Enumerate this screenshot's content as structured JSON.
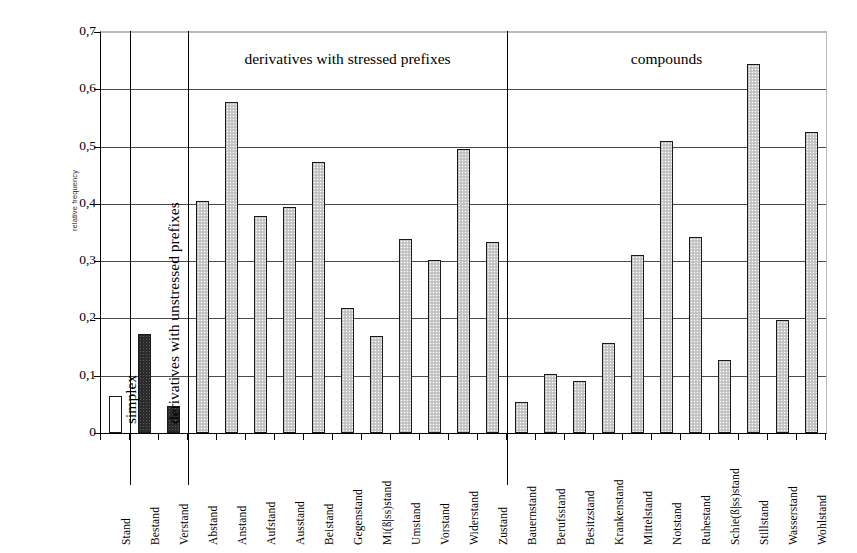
{
  "chart_data": {
    "type": "bar",
    "title": "",
    "xlabel": "",
    "ylabel": "relative frequency",
    "ylim": [
      0,
      0.7
    ],
    "ytick_values": [
      0,
      0.1,
      0.2,
      0.3,
      0.4,
      0.5,
      0.6,
      0.7
    ],
    "ytick_labels": [
      "0",
      "0,1",
      "0,2",
      "0,3",
      "0,4",
      "0,5",
      "0,6",
      "0,7"
    ],
    "decimal_separator": ",",
    "grid": true,
    "legend": "none",
    "bar_styles": {
      "white": "unfilled white bar with dark outline",
      "dark": "dark/black stippled fill with dark outline",
      "light": "light gray stippled fill with dark outline"
    },
    "groups": [
      {
        "label": "simplex",
        "label_orientation": "vertical",
        "categories": [
          "Stand"
        ],
        "values": [
          0.065
        ],
        "styles": [
          "white"
        ]
      },
      {
        "label": "derivatives with unstressed prefixes",
        "label_orientation": "vertical",
        "categories": [
          "Bestand",
          "Verstand"
        ],
        "values": [
          0.172,
          0.048
        ],
        "styles": [
          "dark",
          "dark"
        ]
      },
      {
        "label": "derivatives with stressed prefixes",
        "label_orientation": "horizontal",
        "categories": [
          "Abstand",
          "Anstand",
          "Aufstand",
          "Ausstand",
          "Beistand",
          "Gegenstand",
          "Mi(ß|ss)stand",
          "Umstand",
          "Vorstand",
          "Widerstand",
          "Zustand"
        ],
        "values": [
          0.405,
          0.578,
          0.379,
          0.394,
          0.473,
          0.219,
          0.17,
          0.338,
          0.302,
          0.495,
          0.334
        ],
        "styles": [
          "light",
          "light",
          "light",
          "light",
          "light",
          "light",
          "light",
          "light",
          "light",
          "light",
          "light"
        ]
      },
      {
        "label": "compounds",
        "label_orientation": "horizontal",
        "categories": [
          "Bauernstand",
          "Berufsstand",
          "Besitzstand",
          "Krankenstand",
          "Mittelstand",
          "Notstand",
          "Ruhestand",
          "Schie(ß|ss)stand",
          "Stillstand",
          "Wasserstand",
          "Wohlstand"
        ],
        "values": [
          0.055,
          0.103,
          0.09,
          0.158,
          0.31,
          0.51,
          0.343,
          0.128,
          0.645,
          0.197,
          0.525
        ],
        "styles": [
          "light",
          "light",
          "light",
          "light",
          "light",
          "light",
          "light",
          "light",
          "light",
          "light",
          "light"
        ]
      }
    ],
    "categories": [
      "Stand",
      "Bestand",
      "Verstand",
      "Abstand",
      "Anstand",
      "Aufstand",
      "Ausstand",
      "Beistand",
      "Gegenstand",
      "Mi(ß|ss)stand",
      "Umstand",
      "Vorstand",
      "Widerstand",
      "Zustand",
      "Bauernstand",
      "Berufsstand",
      "Besitzstand",
      "Krankenstand",
      "Mittelstand",
      "Notstand",
      "Ruhestand",
      "Schie(ß|ss)stand",
      "Stillstand",
      "Wasserstand",
      "Wohlstand"
    ],
    "values": [
      0.065,
      0.172,
      0.048,
      0.405,
      0.578,
      0.379,
      0.394,
      0.473,
      0.219,
      0.17,
      0.338,
      0.302,
      0.495,
      0.334,
      0.055,
      0.103,
      0.09,
      0.158,
      0.31,
      0.51,
      0.343,
      0.128,
      0.645,
      0.197,
      0.525
    ]
  }
}
